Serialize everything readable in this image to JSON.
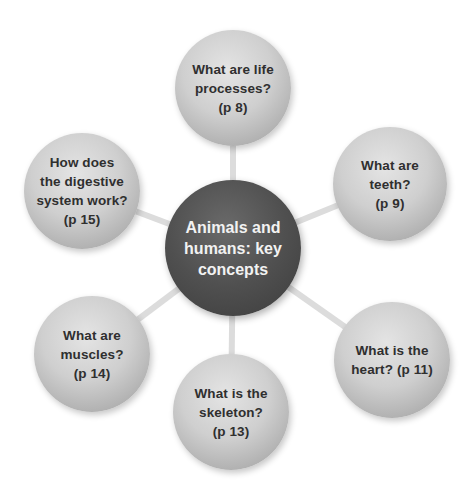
{
  "diagram": {
    "type": "mind-map",
    "hub": {
      "label": "Animals and\nhumans: key\nconcepts",
      "cx": 233,
      "cy": 248,
      "r": 68
    },
    "nodes": [
      {
        "id": "life-processes",
        "label": "What are life\nprocesses?\n(p 8)",
        "cx": 233,
        "cy": 88,
        "r": 58
      },
      {
        "id": "teeth",
        "label": "What are\nteeth?\n(p 9)",
        "cx": 390,
        "cy": 184,
        "r": 57
      },
      {
        "id": "heart",
        "label": "What is the\nheart? (p 11)",
        "cx": 392,
        "cy": 360,
        "r": 58
      },
      {
        "id": "skeleton",
        "label": "What is the\nskeleton?\n(p 13)",
        "cx": 231,
        "cy": 412,
        "r": 58
      },
      {
        "id": "muscles",
        "label": "What are\nmuscles?\n(p 14)",
        "cx": 92,
        "cy": 354,
        "r": 58
      },
      {
        "id": "digestive-system",
        "label": "How does\nthe digestive\nsystem work?\n(p 15)",
        "cx": 82,
        "cy": 191,
        "r": 58
      }
    ]
  },
  "colors": {
    "background": "#ffffff",
    "hub": "#4a4a4a",
    "satellite": "#c8c8c8",
    "connector": "#dcdcdc"
  }
}
